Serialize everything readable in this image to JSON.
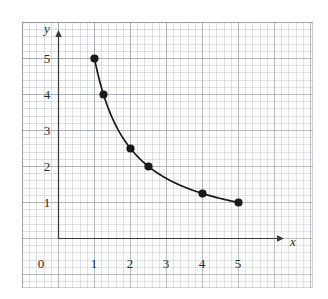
{
  "chart_data": {
    "type": "line",
    "title": "",
    "subtitle": "",
    "xlabel": "x",
    "ylabel": "y",
    "xlim": [
      -1,
      6.25
    ],
    "ylim": [
      -1.5,
      6
    ],
    "grid": true,
    "grid_style": "graph-paper",
    "legend": "none",
    "curve_equation": "y = 5/x",
    "x": [
      1,
      1.25,
      2,
      2.5,
      4,
      5
    ],
    "values": [
      5,
      4,
      2.5,
      2,
      1.25,
      1
    ],
    "points": [
      {
        "x": 1,
        "y": 5
      },
      {
        "x": 1.25,
        "y": 4
      },
      {
        "x": 2,
        "y": 2.5
      },
      {
        "x": 2.5,
        "y": 2
      },
      {
        "x": 4,
        "y": 1.25
      },
      {
        "x": 5,
        "y": 1
      }
    ],
    "marker": "filled-circle",
    "marker_color": "#1a1a1a",
    "line_color": "#1a1a1a",
    "xticks": [
      0,
      1,
      2,
      3,
      4,
      5
    ],
    "xtick_labels": [
      "0",
      "1",
      "2",
      "3",
      "4",
      "5"
    ],
    "yticks": [
      1,
      2,
      3,
      4,
      5
    ],
    "ytick_labels": [
      "1",
      "2",
      "3",
      "4",
      "5"
    ],
    "axis_arrows": {
      "x": "right",
      "y": "up"
    },
    "origin_label": "0"
  },
  "axes": {
    "x_axis_name": "x",
    "y_axis_name": "y"
  },
  "colors": {
    "curve": "#1a1a1a",
    "axis": "#3a3a3a",
    "major_grid": "#78849 6",
    "minor_grid": "#96a3b6",
    "paper": "#fdfdfd",
    "text": "#2b2b2b"
  }
}
